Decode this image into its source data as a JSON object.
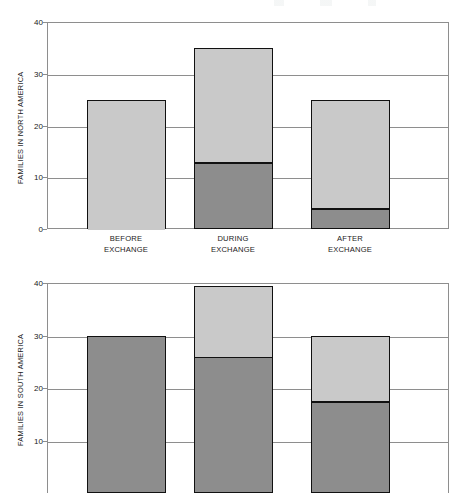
{
  "figure": {
    "note_cropped_bottom": "bottom panel is cut off by the image edge"
  },
  "chart_data": {
    "type": "bar",
    "stacked": true,
    "title": "",
    "xlabel": "",
    "grid": true,
    "legend": "none",
    "panels": [
      {
        "id": "north-america",
        "ylabel": "FAMILIES IN NORTH AMERICA",
        "ylim": [
          0,
          40
        ],
        "yticks": [
          0,
          10,
          20,
          30,
          40
        ],
        "ytick_labels": [
          "0",
          "10",
          "20",
          "30",
          "40"
        ],
        "categories": [
          "BEFORE\nEXCHANGE",
          "DURING\nEXCHANGE",
          "AFTER\nEXCHANGE"
        ],
        "series": [
          {
            "name": "dark-segment",
            "values": [
              0,
              13,
              4
            ]
          },
          {
            "name": "light-segment",
            "values": [
              25,
              22,
              21
            ]
          }
        ],
        "totals": [
          25,
          35,
          25
        ]
      },
      {
        "id": "south-america",
        "ylabel": "FAMILIES IN SOUTH AMERICA",
        "ylim": [
          0,
          40
        ],
        "yticks": [
          10,
          20,
          30,
          40
        ],
        "ytick_labels": [
          "10",
          "20",
          "30",
          "40"
        ],
        "categories": [
          "BEFORE\nEXCHANGE",
          "DURING\nEXCHANGE",
          "AFTER\nEXCHANGE"
        ],
        "series": [
          {
            "name": "dark-segment",
            "values": [
              30,
              26,
              17.5
            ]
          },
          {
            "name": "light-segment",
            "values": [
              0,
              13.5,
              12.5
            ]
          }
        ],
        "totals": [
          30,
          39.5,
          30
        ],
        "cropped": true
      }
    ],
    "colors": {
      "light_segment": "#c9c9c9",
      "dark_segment": "#8d8d8d",
      "bar_outline": "#111111",
      "axis": "#8e8e8e",
      "text": "#1a1a1a"
    }
  }
}
